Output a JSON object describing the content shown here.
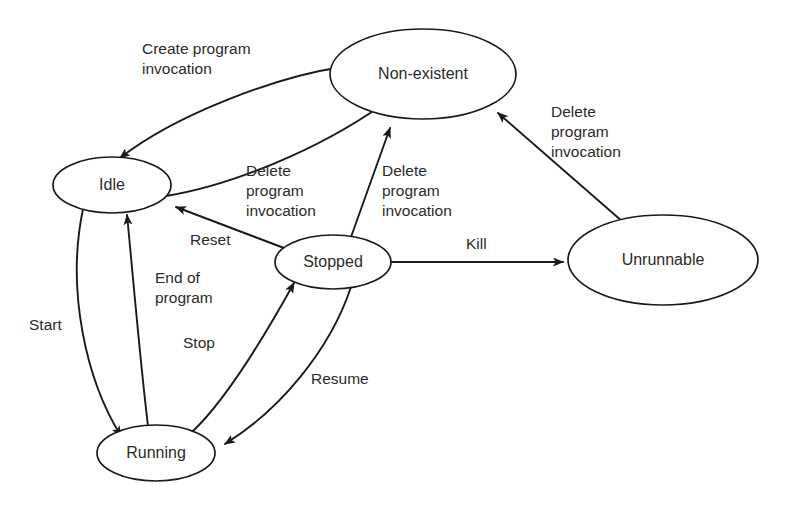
{
  "diagram": {
    "type": "state-transition-diagram",
    "background_color": "#ffffff",
    "line_color": "#1a1a1a",
    "text_color": "#2b2b2b",
    "states": [
      {
        "id": "non-existent",
        "label": "Non-existent",
        "cx": 423,
        "cy": 74,
        "rx": 93,
        "ry": 45
      },
      {
        "id": "idle",
        "label": "Idle",
        "cx": 112,
        "cy": 185,
        "rx": 59,
        "ry": 28
      },
      {
        "id": "stopped",
        "label": "Stopped",
        "cx": 333,
        "cy": 262,
        "rx": 58,
        "ry": 27
      },
      {
        "id": "unrunnable",
        "label": "Unrunnable",
        "cx": 663,
        "cy": 260,
        "rx": 95,
        "ry": 45
      },
      {
        "id": "running",
        "label": "Running",
        "cx": 156,
        "cy": 453,
        "rx": 59,
        "ry": 28
      }
    ],
    "transitions": [
      {
        "id": "non-existent-to-idle",
        "from": "non-existent",
        "to": "idle",
        "label_lines": [
          "Create program",
          "invocation"
        ],
        "label_x": 142,
        "label_y": 54
      },
      {
        "id": "idle-to-non-existent",
        "from": "idle",
        "to": "non-existent",
        "label_lines": [
          "Delete",
          "program",
          "invocation"
        ],
        "label_x": 246,
        "label_y": 176
      },
      {
        "id": "stopped-to-non-existent",
        "from": "stopped",
        "to": "non-existent",
        "label_lines": [
          "Delete",
          "program",
          "invocation"
        ],
        "label_x": 382,
        "label_y": 176
      },
      {
        "id": "unrunnable-to-non-existent",
        "from": "unrunnable",
        "to": "non-existent",
        "label_lines": [
          "Delete",
          "program",
          "invocation"
        ],
        "label_x": 551,
        "label_y": 117
      },
      {
        "id": "stopped-to-idle",
        "from": "stopped",
        "to": "idle",
        "label_lines": [
          "Reset"
        ],
        "label_x": 190,
        "label_y": 245
      },
      {
        "id": "stopped-to-unrunnable",
        "from": "stopped",
        "to": "unrunnable",
        "label_lines": [
          "Kill"
        ],
        "label_x": 466,
        "label_y": 249
      },
      {
        "id": "idle-to-running",
        "from": "idle",
        "to": "running",
        "label_lines": [
          "Start"
        ],
        "label_x": 29,
        "label_y": 330
      },
      {
        "id": "running-to-idle",
        "from": "running",
        "to": "idle",
        "label_lines": [
          "End of",
          "program"
        ],
        "label_x": 155,
        "label_y": 283
      },
      {
        "id": "running-to-stopped",
        "from": "running",
        "to": "stopped",
        "label_lines": [
          "Stop"
        ],
        "label_x": 183,
        "label_y": 348
      },
      {
        "id": "stopped-to-running",
        "from": "stopped",
        "to": "running",
        "label_lines": [
          "Resume"
        ],
        "label_x": 311,
        "label_y": 384
      }
    ]
  }
}
